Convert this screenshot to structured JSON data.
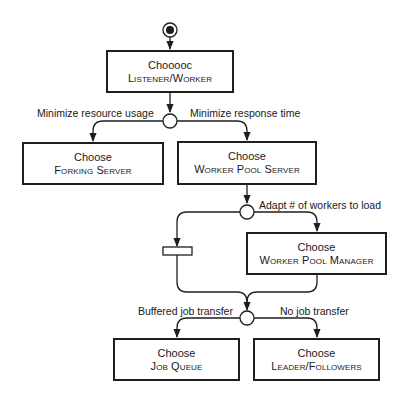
{
  "diagram": {
    "type": "activity-diagram",
    "colors": {
      "stroke": "#1e1e1e",
      "background": "#ffffff"
    },
    "nodes": {
      "start": {
        "kind": "initial-node"
      },
      "listener_worker": {
        "line1": "Chooooc",
        "line2": "Listener/Worker"
      },
      "decision1": {
        "kind": "decision"
      },
      "forking_server": {
        "line1": "Choose",
        "line2": "Forking Server"
      },
      "worker_pool_server": {
        "line1": "Choose",
        "line2": "Worker Pool Server"
      },
      "decision2": {
        "kind": "decision"
      },
      "bar": {
        "kind": "synchronization-bar"
      },
      "worker_pool_manager": {
        "line1": "Choose",
        "line2": "Worker Pool Manager"
      },
      "decision3": {
        "kind": "decision"
      },
      "job_queue": {
        "line1": "Choose",
        "line2": "Job Queue"
      },
      "leader_followers": {
        "line1": "Choose",
        "line2": "Leader/Followers"
      }
    },
    "edge_labels": {
      "min_resource": "Minimize resource usage",
      "min_response": "Minimize response time",
      "adapt_workers": "Adapt # of workers to load",
      "buffered": "Buffered job transfer",
      "no_transfer": "No job transfer"
    }
  }
}
